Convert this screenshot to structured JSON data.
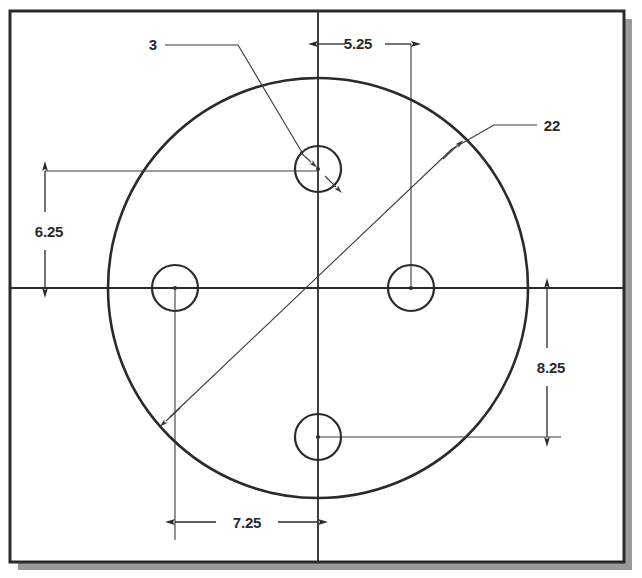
{
  "drawing": {
    "title": "Circular plate with four holes - dimensioned engineering drawing",
    "background_color": "#ffffff",
    "line_color": "#2a2a2e",
    "thin_line_color": "#4a4a50",
    "shadow_color": "#9a9a9a",
    "frame": {
      "x": 10,
      "y": 11,
      "width": 614,
      "height": 551,
      "stroke_width": 3
    },
    "shadow": {
      "offset_x": 8,
      "offset_y": 8
    },
    "centerlines": {
      "horizontal_y": 288,
      "vertical_x": 318
    },
    "plate_circle": {
      "cx": 318,
      "cy": 288,
      "r": 210,
      "stroke_width": 2.6
    },
    "holes": [
      {
        "name": "top-hole",
        "cx": 318,
        "cy": 169,
        "r": 23
      },
      {
        "name": "left-hole",
        "cx": 175,
        "cy": 288,
        "r": 23
      },
      {
        "name": "right-hole",
        "cx": 411,
        "cy": 288,
        "r": 23
      },
      {
        "name": "bottom-hole",
        "cx": 318,
        "cy": 437,
        "r": 23
      }
    ]
  },
  "dimensions": {
    "hole_diameter": {
      "value": "3",
      "label_x": 152,
      "label_y": 50,
      "kind": "diameter",
      "target": "top-hole"
    },
    "plate_diameter": {
      "value": "22",
      "label_x": 551,
      "label_y": 131,
      "kind": "diameter",
      "target": "plate-circle"
    },
    "top_horizontal": {
      "value": "5.25",
      "label_x": 358,
      "label_y": 49,
      "from_x": 318,
      "to_x": 411,
      "line_y": 44,
      "orientation": "horizontal"
    },
    "left_vertical": {
      "value": "6.25",
      "label_x": 49,
      "label_y": 232,
      "from_y": 171,
      "to_y": 288,
      "line_x": 45,
      "orientation": "vertical"
    },
    "right_vertical": {
      "value": "8.25",
      "label_x": 551,
      "label_y": 372,
      "from_y": 288,
      "to_y": 437,
      "line_x": 547,
      "orientation": "vertical"
    },
    "bottom_horizontal": {
      "value": "7.25",
      "label_x": 246,
      "label_y": 527,
      "from_x": 175,
      "to_x": 318,
      "line_y": 522,
      "orientation": "horizontal"
    }
  }
}
